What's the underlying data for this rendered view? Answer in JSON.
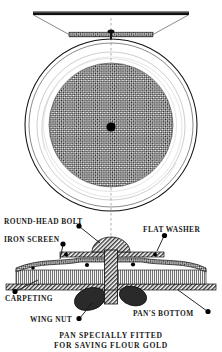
{
  "figure": {
    "title": "Pan specially fitted for saving flour gold",
    "caption_line1": "PAN SPECIALLY FITTED",
    "caption_line2": "FOR SAVING FLOUR GOLD",
    "colors": {
      "ink": "#111111",
      "paper": "#ffffff",
      "hatch": "#2b2b2b",
      "faint": "#9a9a9a",
      "centerline": "#8a8a8a"
    },
    "views": [
      {
        "name": "sectional-elevation",
        "description": "Pan shown in section from the side with screen across it"
      },
      {
        "name": "plan-view",
        "description": "Pan seen from above showing circular iron screen disc and central bolt head"
      },
      {
        "name": "detail-section",
        "description": "Enlarged cross-section of the bolt, washers, screen, carpeting and pan bottom"
      }
    ],
    "labels": [
      {
        "id": "round-head-bolt",
        "text": "ROUND-HEAD BOLT"
      },
      {
        "id": "flat-washer",
        "text": "FLAT WASHER"
      },
      {
        "id": "iron-screen",
        "text": "IRON SCREEN"
      },
      {
        "id": "carpeting",
        "text": "CARPETING"
      },
      {
        "id": "wing-nut",
        "text": "WING NUT"
      },
      {
        "id": "pans-bottom",
        "text": "PAN'S BOTTOM"
      }
    ]
  }
}
